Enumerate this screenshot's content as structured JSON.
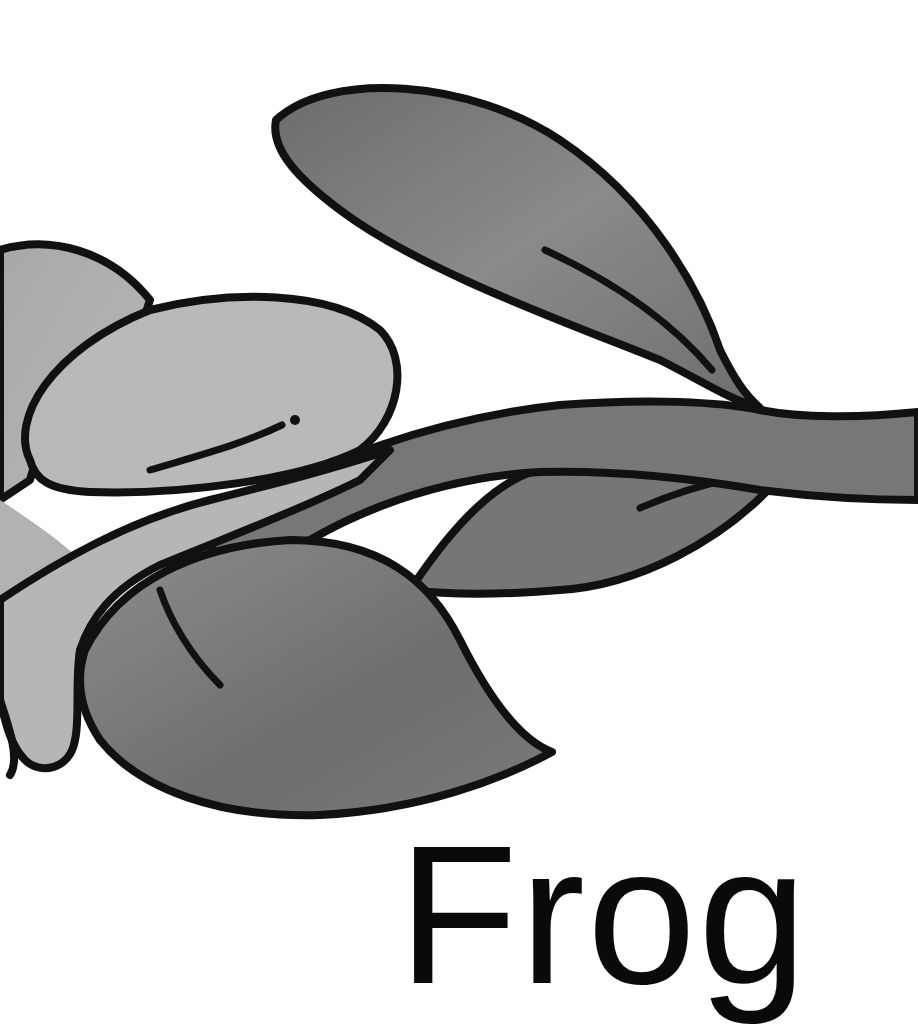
{
  "illustration": {
    "subject": "frog on a leafy branch",
    "style": "grayscale marker illustration with thick black outlines"
  },
  "caption": {
    "text": "Frog"
  },
  "colors": {
    "background": "#ffffff",
    "outline": "#111111",
    "frog_light": "#b4b4b4",
    "frog_shadow": "#9a9a9a",
    "leaf": "#7a7a7a",
    "leaf_dark": "#6a6a6a",
    "stem": "#747474"
  }
}
